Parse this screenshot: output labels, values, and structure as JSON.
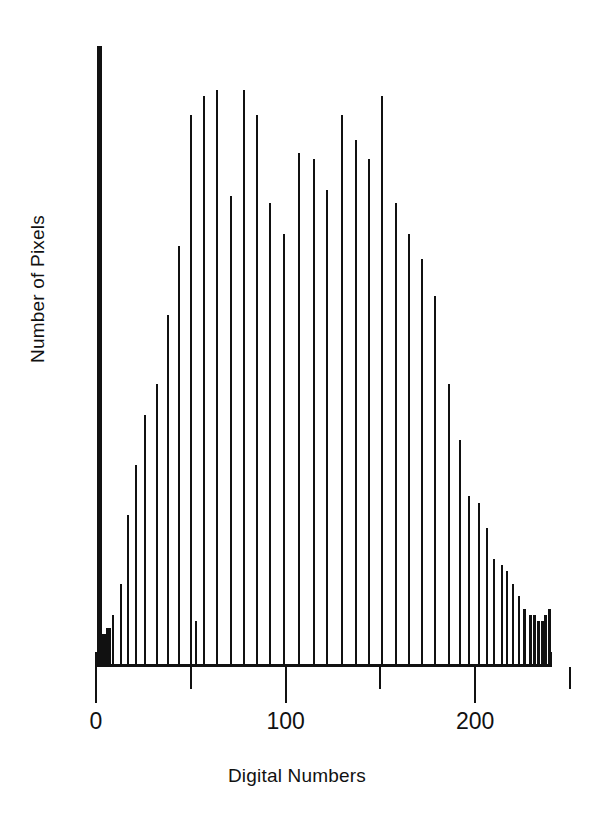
{
  "chart_data": {
    "type": "bar",
    "title": "",
    "subtitle": "",
    "xlabel": "Digital Numbers",
    "ylabel": "Number of Pixels",
    "grid": false,
    "legend": null,
    "xlim": [
      0,
      240
    ],
    "ylim": [
      0,
      100
    ],
    "xticks": [
      0,
      50,
      100,
      150,
      200,
      250
    ],
    "xticklabels": [
      "0",
      "",
      "100",
      "",
      "200",
      ""
    ],
    "xticklabels_shown": [
      {
        "value": 0,
        "label": "0"
      },
      {
        "value": 100,
        "label": "100"
      },
      {
        "value": 200,
        "label": "200"
      }
    ],
    "yticks": [],
    "yticklabels": [],
    "note": "Single-series line-spike histogram of image digital numbers; y axis unlabelled (relative counts).",
    "x": [
      1,
      2,
      3,
      4,
      5,
      6,
      9,
      13,
      17,
      21,
      26,
      32,
      38,
      44,
      50,
      53,
      57,
      64,
      71,
      78,
      85,
      92,
      99,
      107,
      115,
      122,
      130,
      137,
      144,
      151,
      158,
      165,
      172,
      179,
      186,
      192,
      197,
      202,
      206,
      210,
      214,
      217,
      220,
      223,
      226,
      229,
      231,
      233,
      235,
      237,
      239
    ],
    "values": [
      99,
      5,
      5,
      5,
      5,
      6,
      8,
      13,
      24,
      32,
      40,
      45,
      56,
      67,
      88,
      7,
      91,
      92,
      75,
      92,
      88,
      74,
      69,
      82,
      81,
      76,
      88,
      84,
      81,
      91,
      74,
      69,
      65,
      59,
      45,
      36,
      27,
      26,
      22,
      17,
      16,
      15,
      13,
      11,
      9,
      8,
      8,
      7,
      7,
      8,
      9
    ],
    "series": [
      {
        "name": "Pixel count",
        "color": "#111111",
        "values": [
          99,
          5,
          5,
          5,
          5,
          6,
          8,
          13,
          24,
          32,
          40,
          45,
          56,
          67,
          88,
          7,
          91,
          92,
          75,
          92,
          88,
          74,
          69,
          82,
          81,
          76,
          88,
          84,
          81,
          91,
          74,
          69,
          65,
          59,
          45,
          36,
          27,
          26,
          22,
          17,
          16,
          15,
          13,
          11,
          9,
          8,
          8,
          7,
          7,
          8,
          9
        ]
      }
    ]
  },
  "colors": {
    "ink": "#111111",
    "background": "#ffffff"
  }
}
